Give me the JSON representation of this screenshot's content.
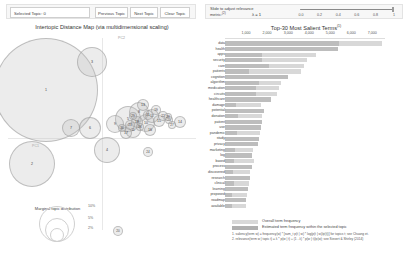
{
  "left_panel": {
    "selected_topic_label": "Selected Topic:",
    "selected_topic_value": "0",
    "prev_button": "Previous Topic",
    "next_button": "Next Topic",
    "clear_button": "Clear Topic",
    "title": "Intertopic Distance Map (via multidimensional scaling)",
    "axis_x_label": "PC1",
    "axis_y_label": "PC2",
    "marginal_title": "Marginal topic distribution",
    "marginal_legend": [
      "2%",
      "5%",
      "10%"
    ]
  },
  "right_panel": {
    "lambda_label_line1": "Slide to adjust relevance",
    "lambda_label_line2": "metric:",
    "lambda_superscript": "(2)",
    "lambda_value": "λ = 1",
    "slider_ticks": [
      "0.0",
      "0.2",
      "0.4",
      "0.6",
      "0.8",
      "1"
    ],
    "slider_position": 1,
    "title": "Top-30 Most Salient Terms",
    "title_superscript": "(1)",
    "legend_overall": "Overall term frequency",
    "legend_estimated": "Estimated term frequency within the selected topic",
    "footnote1": "1. saliency(term w) = frequency(w) * [sum_t p(t | w) * log(p(t | w)/p(t))] for topics t; see Chuang et.",
    "footnote2": "2. relevance(term w | topic t) = λ * p(w | t) + (1 - λ) * p(w | t)/p(w); see Sievert & Shirley (2014)"
  },
  "chart_data": {
    "type": "bar",
    "title": "Top-30 Most Salient Terms",
    "xlabel": "",
    "ylabel": "",
    "xlim": [
      0,
      7600
    ],
    "grid": false,
    "legend_position": "bottom",
    "axis_ticks": [
      1000,
      2000,
      3000,
      4000,
      5000,
      6000,
      7000
    ],
    "categories": [
      "data",
      "health",
      "apps",
      "security",
      "care",
      "patients",
      "cognition",
      "algorithm",
      "medication",
      "circuits",
      "healthcare",
      "damage",
      "potential",
      "donation",
      "patient",
      "use",
      "pandemic",
      "study",
      "privacy",
      "marketing",
      "log",
      "based",
      "process",
      "discovered",
      "research",
      "clinical",
      "learning",
      "proposed",
      "roadmap",
      "available"
    ],
    "series": [
      {
        "name": "Overall term frequency",
        "values": [
          7450,
          5350,
          4300,
          3900,
          3750,
          3600,
          3000,
          2650,
          2550,
          2450,
          2200,
          1700,
          1850,
          1780,
          1750,
          1700,
          1650,
          1600,
          1550,
          1350,
          1300,
          1380,
          1280,
          1180,
          1200,
          1150,
          1100,
          1050,
          1020,
          980
        ]
      },
      {
        "name": "Estimated term frequency within the selected topic",
        "values": [
          5400,
          5350,
          1750,
          1780,
          2100,
          1150,
          3000,
          1600,
          1450,
          1450,
          2200,
          520,
          1850,
          640,
          1750,
          1700,
          560,
          1600,
          1550,
          470,
          1300,
          420,
          1280,
          370,
          1200,
          420,
          1100,
          350,
          1020,
          330
        ]
      }
    ]
  },
  "topics": [
    {
      "id": "1",
      "x": 46,
      "y": 60,
      "r": 52
    },
    {
      "id": "2",
      "x": 32,
      "y": 134,
      "r": 23
    },
    {
      "id": "3",
      "x": 92,
      "y": 32,
      "r": 15
    },
    {
      "id": "4",
      "x": 107,
      "y": 120,
      "r": 13
    },
    {
      "id": "5",
      "x": 128,
      "y": 89,
      "r": 13
    },
    {
      "id": "6",
      "x": 90,
      "y": 98,
      "r": 11
    },
    {
      "id": "7",
      "x": 71,
      "y": 98,
      "r": 9
    },
    {
      "id": "8",
      "x": 139,
      "y": 82,
      "r": 10
    },
    {
      "id": "9",
      "x": 115,
      "y": 94,
      "r": 9
    },
    {
      "id": "10",
      "x": 146,
      "y": 93,
      "r": 9
    },
    {
      "id": "11",
      "x": 133,
      "y": 100,
      "r": 8
    },
    {
      "id": "12",
      "x": 152,
      "y": 86,
      "r": 7
    },
    {
      "id": "13",
      "x": 143,
      "y": 75,
      "r": 6
    },
    {
      "id": "14",
      "x": 180,
      "y": 92,
      "r": 6
    },
    {
      "id": "15",
      "x": 159,
      "y": 91,
      "r": 6
    },
    {
      "id": "16",
      "x": 150,
      "y": 100,
      "r": 6
    },
    {
      "id": "17",
      "x": 126,
      "y": 103,
      "r": 6
    },
    {
      "id": "18",
      "x": 137,
      "y": 92,
      "r": 6
    },
    {
      "id": "19",
      "x": 156,
      "y": 80,
      "r": 5
    },
    {
      "id": "20",
      "x": 118,
      "y": 201,
      "r": 5
    },
    {
      "id": "21",
      "x": 148,
      "y": 85,
      "r": 5
    },
    {
      "id": "22",
      "x": 163,
      "y": 86,
      "r": 5
    },
    {
      "id": "23",
      "x": 130,
      "y": 95,
      "r": 5
    },
    {
      "id": "24",
      "x": 148,
      "y": 122,
      "r": 5
    },
    {
      "id": "25",
      "x": 169,
      "y": 90,
      "r": 4
    },
    {
      "id": "26",
      "x": 140,
      "y": 97,
      "r": 4
    },
    {
      "id": "27",
      "x": 172,
      "y": 95,
      "r": 4
    },
    {
      "id": "28",
      "x": 168,
      "y": 87,
      "r": 4
    },
    {
      "id": "29",
      "x": 133,
      "y": 86,
      "r": 4
    },
    {
      "id": "30",
      "x": 122,
      "y": 98,
      "r": 4
    }
  ]
}
